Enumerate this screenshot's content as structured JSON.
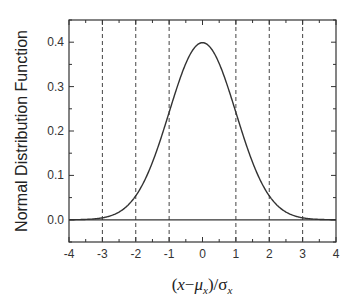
{
  "chart_data": {
    "type": "line",
    "title": "",
    "xlabel": "(x−μx)/σx",
    "xlabel_parts": {
      "open": "(",
      "x": "x",
      "minus": "−",
      "mu": "μ",
      "mu_sub": "x",
      "close": ")/",
      "sigma": "σ",
      "sigma_sub": "x"
    },
    "ylabel": "Normal Distribution Function",
    "xlim": [
      -4,
      4
    ],
    "ylim": [
      -0.05,
      0.45
    ],
    "xticks": [
      -4,
      -3,
      -2,
      -1,
      0,
      1,
      2,
      3,
      4
    ],
    "xtick_labels": [
      "-4",
      "-3",
      "-2",
      "-1",
      "0",
      "1",
      "2",
      "3",
      "4"
    ],
    "yticks": [
      0.0,
      0.1,
      0.2,
      0.3,
      0.4
    ],
    "ytick_labels": [
      "0.0",
      "0.1",
      "0.2",
      "0.3",
      "0.4"
    ],
    "grid": false,
    "vertical_dashed_lines": [
      -3,
      -2,
      -1,
      1,
      2,
      3
    ],
    "horizontal_line": 0.0,
    "series": [
      {
        "name": "Standard normal PDF",
        "function": "exp(-x^2/2)/sqrt(2*pi)",
        "x": [
          -4,
          -3.5,
          -3,
          -2.5,
          -2,
          -1.5,
          -1,
          -0.5,
          0,
          0.5,
          1,
          1.5,
          2,
          2.5,
          3,
          3.5,
          4
        ],
        "y": [
          0.0001,
          0.0009,
          0.0044,
          0.0175,
          0.054,
          0.1295,
          0.242,
          0.3521,
          0.3989,
          0.3521,
          0.242,
          0.1295,
          0.054,
          0.0175,
          0.0044,
          0.0009,
          0.0001
        ]
      }
    ],
    "legend": null
  },
  "colors": {
    "line": "#333333",
    "axis": "#333333",
    "dashed": "#444444",
    "background": "#ffffff"
  }
}
